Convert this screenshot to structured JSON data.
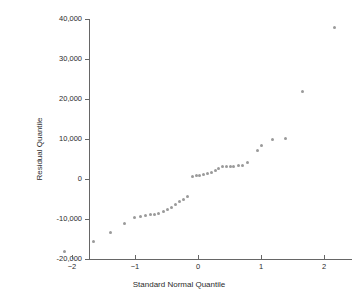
{
  "chart_data": {
    "type": "scatter",
    "title": "",
    "xlabel": "Standard Normal Quantile",
    "ylabel": "Residual Quantile",
    "xlim": [
      -2.4,
      2.4
    ],
    "ylim": [
      -20000,
      40000
    ],
    "xticks": [
      -2,
      -1,
      0,
      1,
      2
    ],
    "xticklabels": [
      "−2",
      "−1",
      "0",
      "1",
      "2"
    ],
    "yticks": [
      -20000,
      -10000,
      0,
      10000,
      20000,
      30000,
      40000
    ],
    "yticklabels": [
      "-20,000",
      "-10,000",
      "0",
      "10,000",
      "20,000",
      "30,000",
      "40,000"
    ],
    "grid": false,
    "legend": false,
    "marker_color": "#9a9a9a",
    "axis_color": "#666666",
    "series": [
      {
        "name": "Residual quantiles",
        "points": [
          [
            -2.12,
            -18000
          ],
          [
            -1.66,
            -15600
          ],
          [
            -1.39,
            -13400
          ],
          [
            -1.17,
            -11200
          ],
          [
            -1.01,
            -9500
          ],
          [
            -0.92,
            -9300
          ],
          [
            -0.84,
            -9100
          ],
          [
            -0.76,
            -8900
          ],
          [
            -0.69,
            -8800
          ],
          [
            -0.62,
            -8700
          ],
          [
            -0.55,
            -8200
          ],
          [
            -0.48,
            -7600
          ],
          [
            -0.42,
            -7000
          ],
          [
            -0.35,
            -6300
          ],
          [
            -0.29,
            -5600
          ],
          [
            -0.23,
            -5100
          ],
          [
            -0.17,
            -4400
          ],
          [
            -0.09,
            700
          ],
          [
            -0.03,
            900
          ],
          [
            0.03,
            1000
          ],
          [
            0.09,
            1200
          ],
          [
            0.15,
            1400
          ],
          [
            0.21,
            1700
          ],
          [
            0.27,
            2100
          ],
          [
            0.33,
            2600
          ],
          [
            0.39,
            3100
          ],
          [
            0.45,
            3200
          ],
          [
            0.51,
            3200
          ],
          [
            0.57,
            3100
          ],
          [
            0.64,
            3300
          ],
          [
            0.71,
            3400
          ],
          [
            0.79,
            4100
          ],
          [
            0.94,
            7200
          ],
          [
            1.01,
            8500
          ],
          [
            1.18,
            9900
          ],
          [
            1.39,
            10100
          ],
          [
            1.66,
            21800
          ],
          [
            2.17,
            38000
          ]
        ]
      }
    ]
  }
}
